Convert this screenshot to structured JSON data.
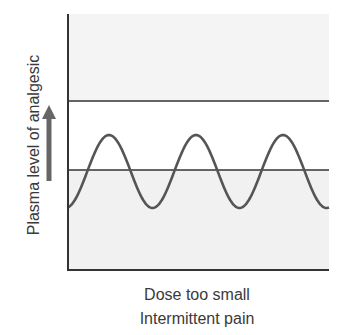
{
  "chart_data": {
    "type": "line",
    "title": "",
    "ylabel": "Plasma level of analgesic",
    "xlabel": [
      "Dose too small",
      "Intermittent pain"
    ],
    "caption_line1": "Dose too small",
    "caption_line2": "Intermittent pain",
    "axis_ticks": "none",
    "grid": false,
    "legend": "none",
    "reference_lines": [
      {
        "name": "upper threshold (toxic level)",
        "pixel_y": 101
      },
      {
        "name": "lower threshold (pain relief level)",
        "pixel_y": 170
      }
    ],
    "regions": [
      {
        "name": "above upper threshold",
        "fill": "#f4f4f4"
      },
      {
        "name": "between thresholds",
        "fill": "#ffffff"
      },
      {
        "name": "below lower threshold",
        "fill": "#f1f1f1"
      }
    ],
    "series": [
      {
        "name": "Plasma level",
        "shape": "sinusoid",
        "cycles": 3,
        "peaks_pixel_x": [
          109,
          197,
          283
        ],
        "peak_pixel_y": 135,
        "trough_pixel_y": 208,
        "note": "Oscillates around the lower threshold: peaks above it, troughs below it; never reaches the upper threshold"
      }
    ],
    "arrow": {
      "direction": "up",
      "meaning": "increasing plasma level"
    }
  },
  "colors": {
    "axis": "#333333",
    "curve": "#555555",
    "arrow": "#666666",
    "top_region": "#f4f4f4",
    "bottom_region": "#f1f1f1"
  }
}
